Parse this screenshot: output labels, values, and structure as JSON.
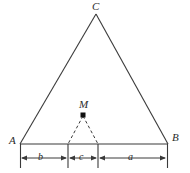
{
  "figure": {
    "name": "triangle-with-interior-point-and-base-segments",
    "background_color": "#ffffff",
    "stroke_color": "#3a3a3a",
    "label_color": "#2b2b2b",
    "vertices": {
      "apex": {
        "label": "C",
        "x": 96,
        "y": 14
      },
      "left": {
        "label": "A",
        "x": 20,
        "y": 144
      },
      "right": {
        "label": "B",
        "x": 168,
        "y": 144
      }
    },
    "interior_point": {
      "label": "M",
      "x": 83,
      "y": 115,
      "marker": "filled-dot"
    },
    "base_dividers": [
      {
        "x": 68
      },
      {
        "x": 98
      }
    ],
    "dashed_connectors": [
      {
        "from": "M",
        "to_x": 68,
        "to_y": 144
      },
      {
        "from": "M",
        "to_x": 98,
        "to_y": 144
      }
    ],
    "dimension_segments": [
      {
        "label": "b",
        "from_x": 20,
        "to_x": 68
      },
      {
        "label": "c",
        "from_x": 68,
        "to_x": 98
      },
      {
        "label": "a",
        "from_x": 98,
        "to_x": 168
      }
    ],
    "dimension_line_y": 158
  }
}
